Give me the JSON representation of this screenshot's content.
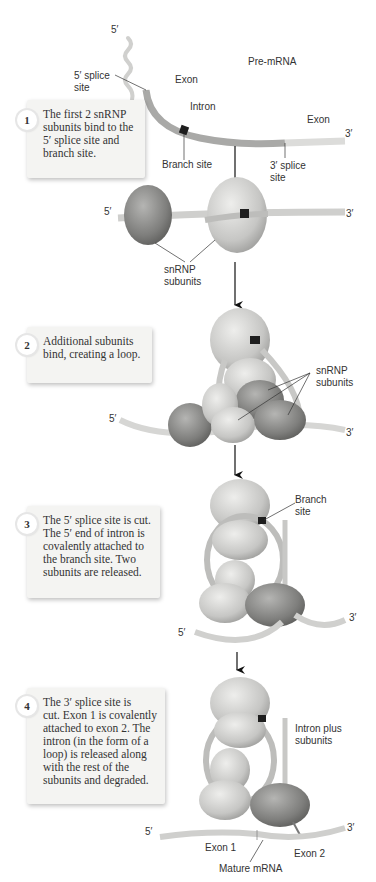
{
  "figure": {
    "stage0": {
      "five_prime": "5′",
      "three_prime": "3′",
      "pre_mrna": "Pre-mRNA",
      "splice5": "5′ splice\nsite",
      "exon_left": "Exon",
      "intron": "Intron",
      "exon_right": "Exon",
      "branch_site": "Branch site",
      "splice3": "3′ splice\nsite"
    },
    "stage1": {
      "five_prime": "5′",
      "three_prime": "3′",
      "snrnp": "snRNP\nsubunits"
    },
    "stage2": {
      "five_prime": "5′",
      "three_prime": "3′",
      "snrnp": "snRNP\nsubunits"
    },
    "stage3": {
      "five_prime": "5′",
      "three_prime": "3′",
      "branch_site": "Branch\nsite"
    },
    "stage4": {
      "intron_plus": "Intron plus\nsubunits",
      "five_prime": "5′",
      "three_prime": "3′",
      "exon1": "Exon 1",
      "exon2": "Exon 2",
      "mature": "Mature mRNA"
    }
  },
  "steps": [
    {
      "number": "1",
      "text": "The first 2 snRNP\nsubunits bind to the\n5′ splice site and\nbranch site."
    },
    {
      "number": "2",
      "text": "Additional subunits\nbind, creating a loop."
    },
    {
      "number": "3",
      "text": "The 5′ splice site is cut.\nThe 5′ end of intron is\ncovalently attached to\nthe branch site. Two\nsubunits are released."
    },
    {
      "number": "4",
      "text": "The 3′ splice site is\ncut. Exon 1 is covalently\nattached to exon 2. The\nintron (in the form of a\nloop) is released along\nwith the rest of the\nsubunits and degraded."
    }
  ],
  "colors": {
    "exon": "#d8d8d6",
    "intron": "#a9a9a7",
    "subunit_dark": "#8a8a88",
    "subunit_light": "#c9c9c7",
    "branch": "#1e1e1e",
    "box_bg": "#f4f4f2"
  }
}
